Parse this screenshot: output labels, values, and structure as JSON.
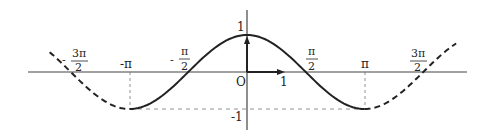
{
  "diagram": {
    "type": "function-graph",
    "function": "y = cos x",
    "colors": {
      "curve": "#222222",
      "axis": "#444444",
      "guide": "#777777",
      "background": "#ffffff"
    },
    "origin_label": "O",
    "x_unit_label": "1",
    "y_labels": {
      "top": "1",
      "bottom": "-1"
    },
    "x_ticks": [
      {
        "id": "neg-3pi-2",
        "sign": "-",
        "num": "3π",
        "den": "2"
      },
      {
        "id": "neg-pi",
        "text": "-π"
      },
      {
        "id": "neg-pi-2",
        "sign": "-",
        "num": "π",
        "den": "2"
      },
      {
        "id": "pi-2",
        "num": "π",
        "den": "2"
      },
      {
        "id": "pi",
        "text": "π"
      },
      {
        "id": "3pi-2",
        "num": "3π",
        "den": "2"
      }
    ],
    "segments": {
      "left_dashed": "x in [-3π/2 - ε, -π]",
      "solid": "x in [-π, π]",
      "right_dashed": "x in [π, 3π/2 + ε]"
    }
  }
}
